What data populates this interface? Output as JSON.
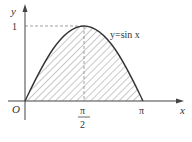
{
  "figure": {
    "function_label": "y=sin x",
    "axes": {
      "x_label": "x",
      "y_label": "y",
      "origin_label": "O"
    },
    "ticks": {
      "y_one": "1",
      "x_half_pi_num": "π",
      "x_half_pi_den": "2",
      "x_pi": "π"
    },
    "shaded_region": "area under y=sin x from 0 to π",
    "colors": {
      "curve": "#333333",
      "hatch": "#777777",
      "axes": "#444444",
      "dashed": "#888888"
    }
  }
}
